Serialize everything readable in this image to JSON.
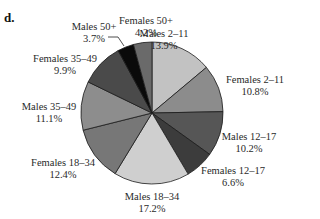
{
  "panel_label": "d.",
  "chart_data": {
    "type": "pie",
    "title": "",
    "center": [
      152,
      113
    ],
    "radius": 71,
    "start_angle_deg": 0,
    "direction": "clockwise",
    "slices": [
      {
        "label": "Males 2–11",
        "value": 13.9,
        "pct_text": "13.9%",
        "color": "#c2c2c2",
        "label_pos": [
          164,
          28
        ]
      },
      {
        "label": "Females 2–11",
        "value": 10.8,
        "pct_text": "10.8%",
        "color": "#8c8c8c",
        "label_pos": [
          255,
          74
        ]
      },
      {
        "label": "Males 12–17",
        "value": 10.2,
        "pct_text": "10.2%",
        "color": "#565656",
        "label_pos": [
          249,
          131
        ]
      },
      {
        "label": "Females 12–17",
        "value": 6.6,
        "pct_text": "6.6%",
        "color": "#3c3c3c",
        "label_pos": [
          233,
          165
        ]
      },
      {
        "label": "Males 18–34",
        "value": 17.2,
        "pct_text": "17.2%",
        "color": "#cfcfcf",
        "label_pos": [
          152,
          191
        ]
      },
      {
        "label": "Females 18–34",
        "value": 12.4,
        "pct_text": "12.4%",
        "color": "#777777",
        "label_pos": [
          63,
          157
        ]
      },
      {
        "label": "Males 35–49",
        "value": 11.1,
        "pct_text": "11.1%",
        "color": "#8d8d8d",
        "label_pos": [
          49,
          101
        ]
      },
      {
        "label": "Females 35–49",
        "value": 9.9,
        "pct_text": "9.9%",
        "color": "#4a4a4a",
        "label_pos": [
          65,
          53
        ]
      },
      {
        "label": "Males 50+",
        "value": 3.7,
        "pct_text": "3.7%",
        "color": "#0a0a0a",
        "label_pos": [
          94,
          21
        ],
        "leader": [
          [
            108,
            37
          ],
          [
            118,
            37
          ],
          [
            124,
            46
          ]
        ]
      },
      {
        "label": "Females 50+",
        "value": 4.2,
        "pct_text": "4.2%",
        "color": "#6a6a6a",
        "label_pos": [
          146,
          15
        ]
      }
    ],
    "legend": "none",
    "labels": [
      "Males 2–11",
      "Females 2–11",
      "Males 12–17",
      "Females 12–17",
      "Males 18–34",
      "Females 18–34",
      "Males 35–49",
      "Females 35–49",
      "Males 50+",
      "Females 50+"
    ],
    "values": [
      13.9,
      10.8,
      10.2,
      6.6,
      17.2,
      12.4,
      11.1,
      9.9,
      3.7,
      4.2
    ]
  }
}
